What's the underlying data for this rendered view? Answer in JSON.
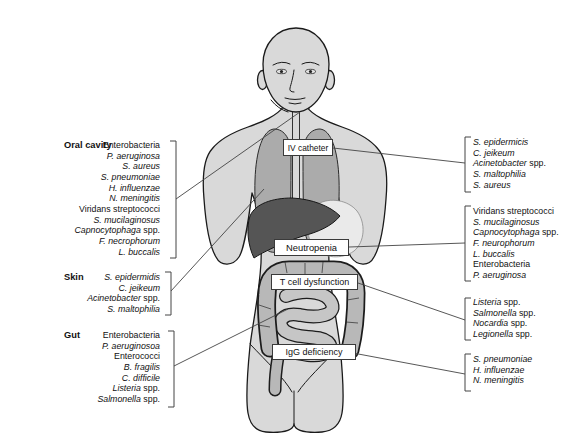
{
  "diagram": {
    "colors": {
      "bg": "#ffffff",
      "body": "#d9d9d9",
      "lung": "#ababab",
      "liver": "#555555",
      "stomach": "#eaeaea",
      "colon": "#b8b8b8",
      "bowel": "#c6c6c6",
      "outline": "#1a1a1a",
      "line": "#444444",
      "text": "#111111",
      "box_bg": "#ffffff",
      "box_border": "#3a3a3a"
    },
    "left_groups": [
      {
        "heading": "Oral cavity",
        "items": [
          {
            "em": "",
            "rest": "Enterobacteria"
          },
          {
            "em": "P. aeruginosa",
            "rest": ""
          },
          {
            "em": "S. aureus",
            "rest": ""
          },
          {
            "em": "S. pneumoniae",
            "rest": ""
          },
          {
            "em": "H. influenzae",
            "rest": ""
          },
          {
            "em": "N. meningitis",
            "rest": ""
          },
          {
            "em": "",
            "rest": "Viridans streptococci"
          },
          {
            "em": "S. mucilaginosus",
            "rest": ""
          },
          {
            "em": "Capnocytophaga",
            "rest": " spp."
          },
          {
            "em": "F. necrophorum",
            "rest": ""
          },
          {
            "em": "L. buccalis",
            "rest": ""
          }
        ]
      },
      {
        "heading": "Skin",
        "items": [
          {
            "em": "S. epidermidis",
            "rest": ""
          },
          {
            "em": "C. jeikeum",
            "rest": ""
          },
          {
            "em": "Acinetobacter",
            "rest": " spp."
          },
          {
            "em": "S. maltophilia",
            "rest": ""
          }
        ]
      },
      {
        "heading": "Gut",
        "items": [
          {
            "em": "",
            "rest": "Enterobacteria"
          },
          {
            "em": "P. aeruginosoa",
            "rest": ""
          },
          {
            "em": "",
            "rest": "Enterococci"
          },
          {
            "em": "B. fragilis",
            "rest": ""
          },
          {
            "em": "C. difficile",
            "rest": ""
          },
          {
            "em": "Listeria",
            "rest": " spp."
          },
          {
            "em": "Salmonella",
            "rest": " spp."
          }
        ]
      }
    ],
    "body_labels": [
      {
        "label": "IV catheter"
      },
      {
        "label": "Neutropenia"
      },
      {
        "label": "T cell dysfunction"
      },
      {
        "label": "IgG deficiency"
      }
    ],
    "right_groups": [
      {
        "items": [
          {
            "em": "S. epidermicis",
            "rest": ""
          },
          {
            "em": "C. jeikeum",
            "rest": ""
          },
          {
            "em": "Acinetobacter",
            "rest": " spp."
          },
          {
            "em": "S. maltophilia",
            "rest": ""
          },
          {
            "em": "S. aureus",
            "rest": ""
          }
        ]
      },
      {
        "items": [
          {
            "em": "",
            "rest": "Viridans streptococci"
          },
          {
            "em": "S. mucilaginosus",
            "rest": ""
          },
          {
            "em": "Capnocytophaga",
            "rest": " spp."
          },
          {
            "em": "F. neurophorum",
            "rest": ""
          },
          {
            "em": "L. buccalis",
            "rest": ""
          },
          {
            "em": "",
            "rest": "Enterobacteria"
          },
          {
            "em": "P. aeruginosa",
            "rest": ""
          }
        ]
      },
      {
        "items": [
          {
            "em": "Listeria",
            "rest": " spp."
          },
          {
            "em": "Salmonella",
            "rest": " spp."
          },
          {
            "em": "Nocardia",
            "rest": " spp."
          },
          {
            "em": "Legionella",
            "rest": " spp."
          }
        ]
      },
      {
        "items": [
          {
            "em": "S. pneumoniae",
            "rest": ""
          },
          {
            "em": "H. influenzae",
            "rest": ""
          },
          {
            "em": "N. meningitis",
            "rest": ""
          }
        ]
      }
    ]
  }
}
